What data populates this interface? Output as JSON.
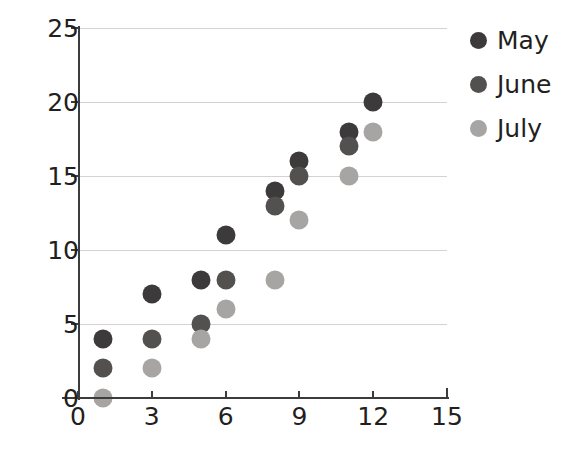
{
  "chart_data": {
    "type": "scatter",
    "title": "",
    "xlabel": "",
    "ylabel": "",
    "xlim": [
      0,
      15
    ],
    "ylim": [
      0,
      25
    ],
    "xticks": [
      0,
      3,
      6,
      9,
      12,
      15
    ],
    "yticks": [
      0,
      5,
      10,
      15,
      20,
      25
    ],
    "xtick_labels": [
      "0",
      "3",
      "6",
      "9",
      "12",
      "15"
    ],
    "ytick_labels": [
      "0",
      "5",
      "10",
      "15",
      "20",
      "25"
    ],
    "grid": "horizontal",
    "legend_position": "right",
    "series": [
      {
        "name": "May",
        "color": "#3c3a3b",
        "points": [
          {
            "x": 1,
            "y": 4
          },
          {
            "x": 3,
            "y": 7
          },
          {
            "x": 5,
            "y": 8
          },
          {
            "x": 6,
            "y": 11
          },
          {
            "x": 8,
            "y": 14
          },
          {
            "x": 9,
            "y": 16
          },
          {
            "x": 11,
            "y": 18
          },
          {
            "x": 12,
            "y": 20
          }
        ]
      },
      {
        "name": "June",
        "color": "#53514f",
        "points": [
          {
            "x": 1,
            "y": 2
          },
          {
            "x": 3,
            "y": 4
          },
          {
            "x": 5,
            "y": 5
          },
          {
            "x": 6,
            "y": 8
          },
          {
            "x": 8,
            "y": 13
          },
          {
            "x": 9,
            "y": 15
          },
          {
            "x": 11,
            "y": 17
          }
        ]
      },
      {
        "name": "July",
        "color": "#a6a5a3",
        "points": [
          {
            "x": 1,
            "y": 0
          },
          {
            "x": 3,
            "y": 2
          },
          {
            "x": 5,
            "y": 4
          },
          {
            "x": 6,
            "y": 6
          },
          {
            "x": 8,
            "y": 8
          },
          {
            "x": 9,
            "y": 12
          },
          {
            "x": 11,
            "y": 15
          },
          {
            "x": 12,
            "y": 18
          }
        ]
      }
    ]
  },
  "legend": {
    "entries": [
      {
        "label": "May",
        "color": "#3c3a3b"
      },
      {
        "label": "June",
        "color": "#53514f"
      },
      {
        "label": "July",
        "color": "#a6a5a3"
      }
    ]
  },
  "axes": {
    "grid_color": "#d3d3d3",
    "axis_color": "#3c3c3c",
    "text_color": "#231f20"
  }
}
